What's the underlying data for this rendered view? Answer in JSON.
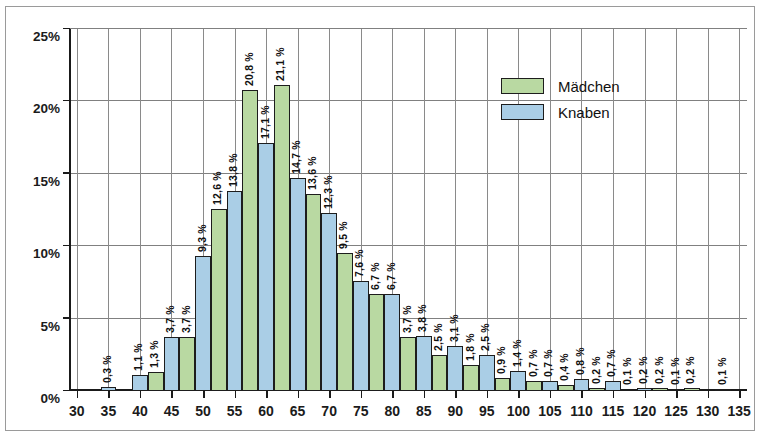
{
  "chart_data": {
    "type": "bar",
    "title": "",
    "xlabel": "",
    "ylabel": "",
    "ylim": [
      0,
      25
    ],
    "ytick_values": [
      0,
      5,
      10,
      15,
      20,
      25
    ],
    "ytick_labels": [
      "0%",
      "5%",
      "10%",
      "15%",
      "20%",
      "25%"
    ],
    "xlim": [
      28.75,
      136.25
    ],
    "xtick_values": [
      30,
      35,
      40,
      45,
      50,
      55,
      60,
      65,
      70,
      75,
      80,
      85,
      90,
      95,
      100,
      105,
      110,
      115,
      120,
      125,
      130,
      135
    ],
    "xtick_labels": [
      "30",
      "35",
      "40",
      "45",
      "50",
      "55",
      "60",
      "65",
      "70",
      "75",
      "80",
      "85",
      "90",
      "95",
      "100",
      "105",
      "110",
      "115",
      "120",
      "125",
      "130",
      "135"
    ],
    "grid": true,
    "legend_position": "upper right",
    "series": [
      {
        "name": "Mädchen",
        "color": "#b9d9a2"
      },
      {
        "name": "Knaben",
        "color": "#aacee6"
      }
    ],
    "bars": [
      {
        "x": 33.75,
        "series": "Knaben",
        "value": 0.3,
        "label": "0,3 %"
      },
      {
        "x": 38.75,
        "series": "Knaben",
        "value": 1.1,
        "label": "1,1 %"
      },
      {
        "x": 41.25,
        "series": "Mädchen",
        "value": 1.3,
        "label": "1,3 %"
      },
      {
        "x": 43.75,
        "series": "Knaben",
        "value": 3.7,
        "label": "3,7 %"
      },
      {
        "x": 46.25,
        "series": "Mädchen",
        "value": 3.7,
        "label": "3,7 %"
      },
      {
        "x": 48.75,
        "series": "Knaben",
        "value": 9.3,
        "label": "9,3 %"
      },
      {
        "x": 51.25,
        "series": "Mädchen",
        "value": 12.6,
        "label": "12,6 %"
      },
      {
        "x": 53.75,
        "series": "Knaben",
        "value": 13.8,
        "label": "13,8 %"
      },
      {
        "x": 56.25,
        "series": "Mädchen",
        "value": 20.8,
        "label": "20,8 %"
      },
      {
        "x": 58.75,
        "series": "Knaben",
        "value": 17.1,
        "label": "17,1 %"
      },
      {
        "x": 61.25,
        "series": "Mädchen",
        "value": 21.1,
        "label": "21,1 %"
      },
      {
        "x": 63.75,
        "series": "Knaben",
        "value": 14.7,
        "label": "14,7 %"
      },
      {
        "x": 66.25,
        "series": "Mädchen",
        "value": 13.6,
        "label": "13,6 %"
      },
      {
        "x": 68.75,
        "series": "Knaben",
        "value": 12.3,
        "label": "12,3 %"
      },
      {
        "x": 71.25,
        "series": "Mädchen",
        "value": 9.5,
        "label": "9,5 %"
      },
      {
        "x": 73.75,
        "series": "Knaben",
        "value": 7.6,
        "label": "7,6 %"
      },
      {
        "x": 76.25,
        "series": "Mädchen",
        "value": 6.7,
        "label": "6,7 %"
      },
      {
        "x": 78.75,
        "series": "Knaben",
        "value": 6.7,
        "label": "6,7 %"
      },
      {
        "x": 81.25,
        "series": "Mädchen",
        "value": 3.7,
        "label": "3,7 %"
      },
      {
        "x": 83.75,
        "series": "Knaben",
        "value": 3.8,
        "label": "3,8 %"
      },
      {
        "x": 86.25,
        "series": "Mädchen",
        "value": 2.5,
        "label": "2,5 %"
      },
      {
        "x": 88.75,
        "series": "Knaben",
        "value": 3.1,
        "label": "3,1 %"
      },
      {
        "x": 91.25,
        "series": "Mädchen",
        "value": 1.8,
        "label": "1,8 %"
      },
      {
        "x": 93.75,
        "series": "Knaben",
        "value": 2.5,
        "label": "2,5 %"
      },
      {
        "x": 96.25,
        "series": "Mädchen",
        "value": 0.9,
        "label": "0,9 %"
      },
      {
        "x": 98.75,
        "series": "Knaben",
        "value": 1.4,
        "label": "1,4 %"
      },
      {
        "x": 101.25,
        "series": "Mädchen",
        "value": 0.7,
        "label": "0,7 %"
      },
      {
        "x": 103.75,
        "series": "Knaben",
        "value": 0.7,
        "label": "0,7 %"
      },
      {
        "x": 106.25,
        "series": "Mädchen",
        "value": 0.4,
        "label": "0,4 %"
      },
      {
        "x": 108.75,
        "series": "Knaben",
        "value": 0.8,
        "label": "0,8 %"
      },
      {
        "x": 111.25,
        "series": "Mädchen",
        "value": 0.2,
        "label": "0,2 %"
      },
      {
        "x": 113.75,
        "series": "Knaben",
        "value": 0.7,
        "label": "0,7 %"
      },
      {
        "x": 116.25,
        "series": "Mädchen",
        "value": 0.1,
        "label": "0,1 %"
      },
      {
        "x": 118.75,
        "series": "Knaben",
        "value": 0.2,
        "label": "0,2 %"
      },
      {
        "x": 121.25,
        "series": "Mädchen",
        "value": 0.2,
        "label": "0,2 %"
      },
      {
        "x": 123.75,
        "series": "Knaben",
        "value": 0.1,
        "label": "0,1 %"
      },
      {
        "x": 126.25,
        "series": "Mädchen",
        "value": 0.2,
        "label": "0,2 %"
      },
      {
        "x": 131.25,
        "series": "Knaben",
        "value": 0.1,
        "label": "0,1 %"
      }
    ]
  },
  "legend": {
    "items": [
      {
        "label": "Mädchen",
        "key": "m"
      },
      {
        "label": "Knaben",
        "key": "k"
      }
    ]
  },
  "colors": {
    "maedchen": "#b9d9a2",
    "knaben": "#aacee6",
    "border": "#1d1d1d",
    "grid": "#808080",
    "axis": "#1a1a1a",
    "frame": "#9a9a9a"
  }
}
